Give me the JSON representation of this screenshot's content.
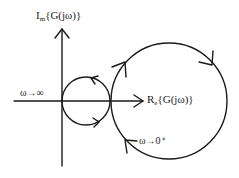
{
  "diagram": {
    "type": "nyquist-plot",
    "axes": {
      "imag": {
        "main": "I",
        "sub": "m",
        "expr": "{G(jω)}"
      },
      "real": {
        "main": "R",
        "sub": "e",
        "expr": "{G(jω)}"
      }
    },
    "annotations": {
      "omega_inf": "ω→∞",
      "omega_zero": "ω→0⁺"
    },
    "curves": [
      {
        "name": "small-circle",
        "cx": 86,
        "cy": 101,
        "r": 24,
        "direction": "counterclockwise"
      },
      {
        "name": "large-circle",
        "cx": 169,
        "cy": 101,
        "r": 58,
        "direction": "clockwise"
      }
    ],
    "colors": {
      "stroke": "#1a1a1a",
      "background": "#ffffff"
    }
  }
}
